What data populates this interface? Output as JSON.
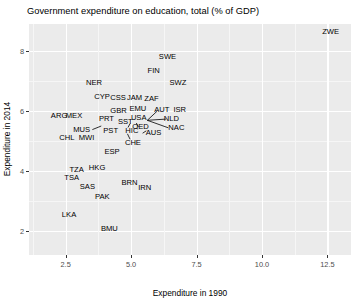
{
  "chart_data": {
    "type": "scatter",
    "title": "Government expenditure on education, total (% of GDP)",
    "xlabel": "Expenditure in 1990",
    "ylabel": "Expenditure in 2014",
    "xlim": [
      1.1,
      13.4
    ],
    "ylim": [
      1.2,
      8.9
    ],
    "xticks": [
      "2.5",
      "5.0",
      "7.5",
      "10.0",
      "12.5"
    ],
    "xtick_values": [
      2.5,
      5.0,
      7.5,
      10.0,
      12.5
    ],
    "yticks": [
      "2",
      "4",
      "6",
      "8"
    ],
    "ytick_values": [
      2,
      4,
      6,
      8
    ],
    "grid": true,
    "legend": "none",
    "point_style": "text-labels",
    "panel_color": "#ebebeb",
    "grid_color": "#ffffff",
    "text_color": "#000000",
    "points": [
      {
        "label": "ZWE",
        "x": 12.62,
        "y": 8.62
      },
      {
        "label": "SWE",
        "x": 6.39,
        "y": 7.81
      },
      {
        "label": "FIN",
        "x": 5.86,
        "y": 7.35
      },
      {
        "label": "NER",
        "x": 3.58,
        "y": 6.94
      },
      {
        "label": "SWZ",
        "x": 6.79,
        "y": 6.92
      },
      {
        "label": "CYP",
        "x": 3.89,
        "y": 6.47
      },
      {
        "label": "CSS",
        "x": 4.5,
        "y": 6.42
      },
      {
        "label": "JAM",
        "x": 5.13,
        "y": 6.42
      },
      {
        "label": "ZAF",
        "x": 5.78,
        "y": 6.4
      },
      {
        "label": "EMU",
        "x": 5.26,
        "y": 6.06
      },
      {
        "label": "AUT",
        "x": 6.17,
        "y": 6.04
      },
      {
        "label": "ISR",
        "x": 6.86,
        "y": 6.03
      },
      {
        "label": "GBR",
        "x": 4.52,
        "y": 6.0
      },
      {
        "label": "ARG",
        "x": 2.25,
        "y": 5.83
      },
      {
        "label": "MEX",
        "x": 2.82,
        "y": 5.83
      },
      {
        "label": "PRT",
        "x": 4.06,
        "y": 5.74
      },
      {
        "label": "USA",
        "x": 5.29,
        "y": 5.78
      },
      {
        "label": "NLD",
        "x": 6.54,
        "y": 5.73
      },
      {
        "label": "SST",
        "x": 4.78,
        "y": 5.64
      },
      {
        "label": "OED",
        "x": 5.36,
        "y": 5.47
      },
      {
        "label": "NAC",
        "x": 6.73,
        "y": 5.45
      },
      {
        "label": "MUS",
        "x": 3.11,
        "y": 5.37
      },
      {
        "label": "PST",
        "x": 4.22,
        "y": 5.35
      },
      {
        "label": "HIC",
        "x": 5.03,
        "y": 5.32
      },
      {
        "label": "AUS",
        "x": 5.86,
        "y": 5.27
      },
      {
        "label": "CHL",
        "x": 2.55,
        "y": 5.11
      },
      {
        "label": "MWI",
        "x": 3.3,
        "y": 5.1
      },
      {
        "label": "CHE",
        "x": 5.07,
        "y": 4.94
      },
      {
        "label": "ESP",
        "x": 4.27,
        "y": 4.62
      },
      {
        "label": "TZA",
        "x": 2.92,
        "y": 4.04
      },
      {
        "label": "HKG",
        "x": 3.7,
        "y": 4.1
      },
      {
        "label": "TSA",
        "x": 2.73,
        "y": 3.76
      },
      {
        "label": "BRN",
        "x": 4.94,
        "y": 3.6
      },
      {
        "label": "SAS",
        "x": 3.33,
        "y": 3.48
      },
      {
        "label": "IRN",
        "x": 5.52,
        "y": 3.42
      },
      {
        "label": "PAK",
        "x": 3.9,
        "y": 3.12
      },
      {
        "label": "LKA",
        "x": 2.63,
        "y": 2.55
      },
      {
        "label": "BMU",
        "x": 4.17,
        "y": 2.06
      }
    ],
    "leader_lines": [
      {
        "from_x": 5.62,
        "from_y": 5.69,
        "to_x": 6.0,
        "to_y": 6.0
      },
      {
        "from_x": 5.62,
        "from_y": 5.69,
        "to_x": 6.33,
        "to_y": 5.73
      },
      {
        "from_x": 5.62,
        "from_y": 5.69,
        "to_x": 6.42,
        "to_y": 5.44
      },
      {
        "from_x": 5.2,
        "from_y": 5.6,
        "to_x": 5.28,
        "to_y": 5.47
      },
      {
        "from_x": 4.96,
        "from_y": 5.58,
        "to_x": 4.88,
        "to_y": 5.45
      },
      {
        "from_x": 3.52,
        "from_y": 5.38,
        "to_x": 3.86,
        "to_y": 5.5
      },
      {
        "from_x": 4.86,
        "from_y": 5.24,
        "to_x": 4.96,
        "to_y": 5.06
      },
      {
        "from_x": 5.44,
        "from_y": 5.26,
        "to_x": 5.58,
        "to_y": 5.34
      }
    ]
  }
}
